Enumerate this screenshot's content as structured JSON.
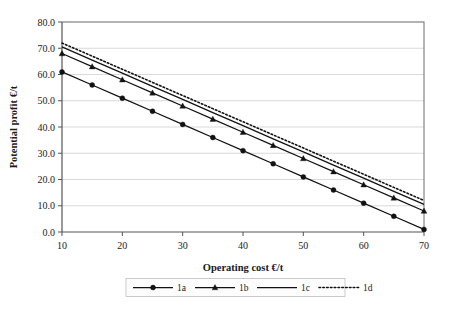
{
  "chart_data": {
    "type": "line",
    "title": "",
    "xlabel": "Operating cost €/t",
    "ylabel": "Potential profit €/t",
    "xlim": [
      10,
      70
    ],
    "ylim": [
      0.0,
      80.0
    ],
    "xticks": [
      "10",
      "20",
      "30",
      "40",
      "50",
      "60",
      "70"
    ],
    "xtick_values": [
      10,
      20,
      30,
      40,
      50,
      60,
      70
    ],
    "yticks": [
      "0.0",
      "10.0",
      "20.0",
      "30.0",
      "40.0",
      "50.0",
      "60.0",
      "70.0",
      "80.0"
    ],
    "ytick_values": [
      0.0,
      10.0,
      20.0,
      30.0,
      40.0,
      50.0,
      60.0,
      70.0,
      80.0
    ],
    "grid": "horizontal",
    "legend_position": "bottom",
    "x": [
      10,
      15,
      20,
      25,
      30,
      35,
      40,
      45,
      50,
      55,
      60,
      65,
      70
    ],
    "series": [
      {
        "name": "1a",
        "marker": "circle",
        "linestyle": "solid",
        "color": "#121212",
        "values": [
          61.0,
          56.0,
          51.0,
          46.0,
          41.0,
          36.0,
          31.0,
          26.0,
          21.0,
          16.0,
          11.0,
          6.0,
          1.0
        ]
      },
      {
        "name": "1b",
        "marker": "triangle",
        "linestyle": "solid",
        "color": "#121212",
        "values": [
          68.0,
          63.0,
          58.0,
          53.0,
          48.0,
          43.0,
          38.0,
          33.0,
          28.0,
          23.0,
          18.0,
          13.0,
          8.0
        ]
      },
      {
        "name": "1c",
        "marker": "none",
        "linestyle": "solid",
        "color": "#121212",
        "values": [
          70.5,
          65.5,
          60.5,
          55.5,
          50.5,
          45.5,
          40.5,
          35.5,
          30.5,
          25.5,
          20.5,
          15.5,
          10.5
        ]
      },
      {
        "name": "1d",
        "marker": "none",
        "linestyle": "dotted",
        "color": "#121212",
        "values": [
          72.0,
          67.0,
          62.0,
          57.0,
          52.0,
          47.0,
          42.0,
          37.0,
          32.0,
          27.0,
          22.0,
          17.0,
          12.0
        ]
      }
    ],
    "legend": [
      {
        "label": "1a",
        "marker": "circle",
        "linestyle": "solid"
      },
      {
        "label": "1b",
        "marker": "triangle",
        "linestyle": "solid"
      },
      {
        "label": "1c",
        "marker": "none",
        "linestyle": "solid"
      },
      {
        "label": "1d",
        "marker": "none",
        "linestyle": "dotted"
      }
    ]
  }
}
